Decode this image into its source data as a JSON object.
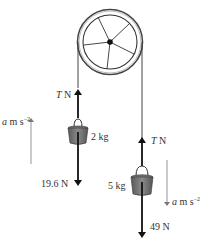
{
  "diagram": {
    "type": "pulley-system",
    "pulley": {
      "description": "fixed pulley wheel with 5 spokes"
    },
    "left_mass": {
      "mass_label": "2 kg",
      "tension_label_var": "T",
      "tension_label_unit": "N",
      "weight_label": "19.6 N",
      "accel_var": "a",
      "accel_unit": "m s",
      "accel_exp": "−2",
      "accel_direction": "up"
    },
    "right_mass": {
      "mass_label": "5 kg",
      "tension_label_var": "T",
      "tension_label_unit": "N",
      "weight_label": "49 N",
      "accel_var": "a",
      "accel_unit": "m s",
      "accel_exp": "−2",
      "accel_direction": "down"
    },
    "colors": {
      "line": "#222222",
      "bucket": "#6b6b6b",
      "accel_arrow": "#888888"
    }
  }
}
